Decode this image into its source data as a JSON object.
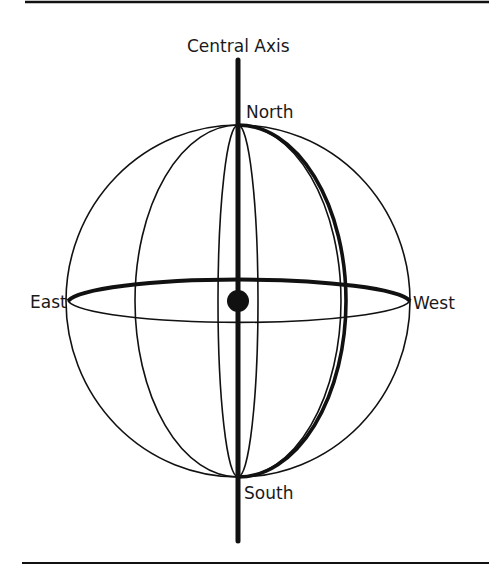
{
  "diagram": {
    "type": "sphere-axis-diagram",
    "labels": {
      "axis": "Central Axis",
      "north": "North",
      "south": "South",
      "east": "East",
      "west": "West"
    },
    "colors": {
      "stroke": "#111111",
      "background": "#ffffff"
    }
  }
}
